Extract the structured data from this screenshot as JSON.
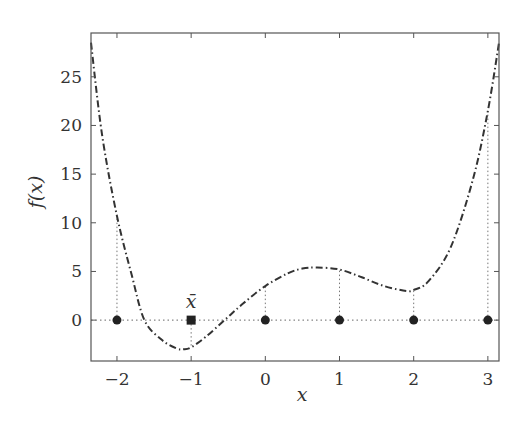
{
  "chart_data": {
    "type": "line",
    "title": "",
    "xlabel": "x",
    "ylabel": "f(x)",
    "xlim": [
      -2.35,
      3.15
    ],
    "ylim": [
      -4.2,
      29.5
    ],
    "grid": false,
    "legend": null,
    "x_ticks": [
      -2,
      -1,
      0,
      1,
      2,
      3
    ],
    "x_tick_labels": [
      "−2",
      "−1",
      "0",
      "1",
      "2",
      "3"
    ],
    "y_ticks": [
      0,
      5,
      10,
      15,
      20,
      25
    ],
    "y_tick_labels": [
      "0",
      "5",
      "10",
      "15",
      "20",
      "25"
    ],
    "series": [
      {
        "name": "f(x)",
        "style": "dash-dot",
        "color": "#333333",
        "x": [
          -2.35,
          -2.2,
          -2.0,
          -1.8,
          -1.63,
          -1.4,
          -1.2,
          -1.1,
          -1.0,
          -0.8,
          -0.55,
          -0.3,
          0.0,
          0.3,
          0.5,
          0.7,
          1.0,
          1.3,
          1.6,
          1.9,
          2.0,
          2.2,
          2.5,
          2.8,
          3.0,
          3.15
        ],
        "y": [
          28.5,
          19.0,
          10.7,
          4.6,
          0.0,
          -2.0,
          -2.9,
          -3.0,
          -2.8,
          -1.7,
          0.0,
          1.7,
          3.5,
          4.8,
          5.3,
          5.4,
          5.2,
          4.4,
          3.5,
          3.0,
          3.1,
          4.0,
          7.5,
          14.5,
          21.5,
          28.5
        ]
      }
    ],
    "markers": {
      "circles": {
        "x": [
          -2,
          0,
          1,
          2,
          3
        ],
        "y": [
          0,
          0,
          0,
          0,
          0
        ]
      },
      "square": {
        "x": -1,
        "y": 0,
        "label": "x̄"
      }
    },
    "drop_lines": {
      "x": [
        -2,
        -1,
        0,
        1,
        2,
        3
      ],
      "to_curve_y": [
        10.7,
        -2.8,
        3.5,
        5.2,
        3.1,
        21.5
      ]
    },
    "reference_line": {
      "y": 0,
      "style": "dotted"
    },
    "annotations": [
      {
        "text": "x̄",
        "x": -1,
        "y": 0,
        "position": "above"
      }
    ]
  },
  "labels": {
    "xlabel": "x",
    "ylabel_f": "f",
    "ylabel_paren": "(x)",
    "xbar": "x̄"
  }
}
